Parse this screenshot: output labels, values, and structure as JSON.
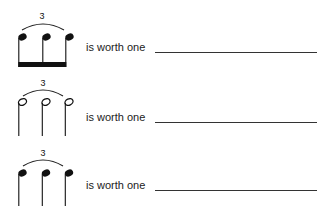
{
  "worksheet": {
    "rows": [
      {
        "tuplet_number": "3",
        "note_type": "eighth-note-triplet-beamed",
        "label": "is worth one",
        "answer": ""
      },
      {
        "tuplet_number": "3",
        "note_type": "half-note-triplet",
        "label": "is worth one",
        "answer": ""
      },
      {
        "tuplet_number": "3",
        "note_type": "quarter-note-triplet",
        "label": "is worth one",
        "answer": ""
      }
    ]
  }
}
